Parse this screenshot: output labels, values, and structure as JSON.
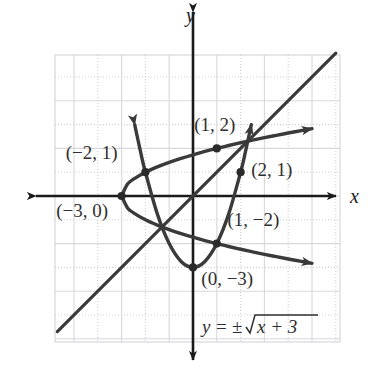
{
  "figure": {
    "kind": "coordinate-graph",
    "axis_labels": {
      "x": "x",
      "y": "y"
    },
    "equation_label": "y = ±√x + 3",
    "equation_parts": {
      "lhs": "y",
      "equals": "=",
      "plusminus": "±",
      "radicand": "x + 3"
    }
  },
  "chart_data": {
    "type": "line",
    "title": "",
    "subtitle": "",
    "xlabel": "x",
    "ylabel": "y",
    "xlim": [
      -5.75,
      6.1
    ],
    "ylim": [
      -6.1,
      5.9
    ],
    "grid": true,
    "grid_step": 1,
    "legend": "none",
    "annotations": [
      {
        "text": "(1, 2)",
        "x": 1,
        "y": 2,
        "label_dx": -0.95,
        "label_dy": 0.75
      },
      {
        "text": "(−2, 1)",
        "x": -2,
        "y": 1,
        "label_dx": -3.35,
        "label_dy": 0.55
      },
      {
        "text": "(2, 1)",
        "x": 2,
        "y": 1,
        "label_dx": 0.45,
        "label_dy": -0.15
      },
      {
        "text": "(−3, 0)",
        "x": -3,
        "y": 0,
        "label_dx": -2.75,
        "label_dy": -0.9
      },
      {
        "text": "(1, −2)",
        "x": 1,
        "y": -2,
        "label_dx": 0.45,
        "label_dy": 0.75
      },
      {
        "text": "(0, −3)",
        "x": 0,
        "y": -3,
        "label_dx": 0.35,
        "label_dy": -0.75
      }
    ],
    "points": [
      {
        "x": 1,
        "y": 2,
        "name": "point-1-2"
      },
      {
        "x": -2,
        "y": 1,
        "name": "point-neg2-1"
      },
      {
        "x": 2,
        "y": 1,
        "name": "point-2-1"
      },
      {
        "x": -3,
        "y": 0,
        "name": "point-neg3-0"
      },
      {
        "x": 1,
        "y": -2,
        "name": "point-1-neg2"
      },
      {
        "x": 0,
        "y": -3,
        "name": "point-0-neg3"
      }
    ],
    "series": [
      {
        "name": "sideways-parabola-upper",
        "equation": "y = +√(x + 3)",
        "description": "upper branch of sideways parabola, vertex (−3, 0), arrow to the right",
        "values": [
          [
            -3,
            0
          ],
          [
            -2.75,
            0.5
          ],
          [
            -2.5,
            0.707
          ],
          [
            -2,
            1
          ],
          [
            -1.5,
            1.225
          ],
          [
            -1,
            1.414
          ],
          [
            -0.5,
            1.581
          ],
          [
            0,
            1.732
          ],
          [
            0.5,
            1.871
          ],
          [
            1,
            2
          ],
          [
            1.5,
            2.121
          ],
          [
            2,
            2.236
          ],
          [
            2.5,
            2.345
          ],
          [
            3,
            2.449
          ],
          [
            3.5,
            2.55
          ],
          [
            4,
            2.646
          ],
          [
            4.5,
            2.739
          ],
          [
            5,
            2.828
          ]
        ]
      },
      {
        "name": "sideways-parabola-lower",
        "equation": "y = −√(x + 3)",
        "description": "lower branch of sideways parabola, vertex (−3, 0), arrow to the right",
        "values": [
          [
            -3,
            0
          ],
          [
            -2.75,
            -0.5
          ],
          [
            -2.5,
            -0.707
          ],
          [
            -2,
            -1
          ],
          [
            -1.5,
            -1.225
          ],
          [
            -1,
            -1.414
          ],
          [
            -0.5,
            -1.581
          ],
          [
            0,
            -1.732
          ],
          [
            0.5,
            -1.871
          ],
          [
            1,
            -2
          ],
          [
            1.5,
            -2.121
          ],
          [
            2,
            -2.236
          ],
          [
            2.5,
            -2.345
          ],
          [
            3,
            -2.449
          ],
          [
            3.5,
            -2.55
          ],
          [
            4,
            -2.646
          ],
          [
            4.5,
            -2.739
          ],
          [
            5,
            -2.828
          ]
        ]
      },
      {
        "name": "upward-parabola",
        "equation": "x = y² − 3 reflected (upward parabola through (−2,1),(0,−3),(2,1))",
        "description": "upward-opening parabola with vertex near (0, −3), arrows up on both ends",
        "values": [
          [
            -2.45,
            3.0
          ],
          [
            -2.2,
            1.84
          ],
          [
            -2,
            1
          ],
          [
            -1.5,
            -0.75
          ],
          [
            -1,
            -2
          ],
          [
            -0.5,
            -2.75
          ],
          [
            0,
            -3
          ],
          [
            0.5,
            -2.75
          ],
          [
            1,
            -2
          ],
          [
            1.5,
            -0.75
          ],
          [
            2,
            1
          ],
          [
            2.2,
            1.84
          ],
          [
            2.45,
            3.0
          ]
        ]
      },
      {
        "name": "diagonal-line",
        "equation": "y = x (slope 1 through origin)",
        "description": "straight diagonal line rising left-to-right, no arrowheads at ends",
        "values": [
          [
            -5.7,
            -5.7
          ],
          [
            6.0,
            6.0
          ]
        ]
      }
    ]
  },
  "geometry": {
    "origin_px": {
      "x": 193,
      "y": 196
    },
    "unit_px": 23.8,
    "plot_rect_px": {
      "left": 55,
      "top": 55,
      "right": 340,
      "bottom": 342
    }
  },
  "colors": {
    "background": "#ffffff",
    "grid_line": "#d8d8dc",
    "grid_dotted": "#cfcfd4",
    "axis": "#1a1a1a",
    "curve": "#3a3a3a",
    "point": "#2a2a2a",
    "text": "#2f2f2f"
  }
}
